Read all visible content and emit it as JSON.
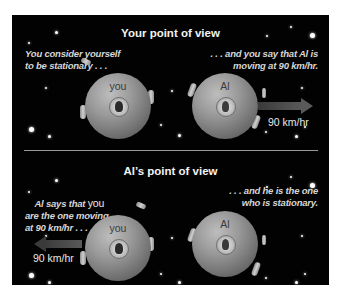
{
  "top_section": {
    "title": "Your point of view",
    "left_caption": "You consider yourself\nto be stationary . . .",
    "right_caption": ". . . and you say that Al is\nmoving at 90 km/hr.",
    "sphere_you_label": "you",
    "sphere_al_label": "Al",
    "arrow_direction": "right",
    "speed_label": "90 km/hr"
  },
  "bottom_section": {
    "title": "Al’s point of view",
    "left_caption_bold": "Al says that ",
    "left_caption_plain": "you",
    "left_caption_rest": "are the one moving\nat 90 km/hr . . .",
    "right_caption": ". . . and he is the one\nwho is stationary.",
    "sphere_you_label": "you",
    "sphere_al_label": "Al",
    "arrow_direction": "left",
    "speed_label": "90 km/hr"
  },
  "colors": {
    "background": "#020202",
    "sphere": "#9a9a9a",
    "text": "#f2f2f2",
    "divider": "#9a9a9a"
  }
}
